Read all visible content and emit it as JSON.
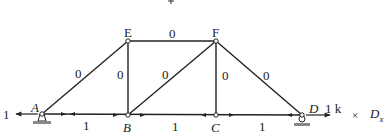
{
  "diagram": {
    "type": "truss",
    "top_marker": "+",
    "nodes": [
      {
        "id": "A",
        "label": "A",
        "x": 42,
        "y": 114,
        "italic": true
      },
      {
        "id": "B",
        "label": "B",
        "x": 128,
        "y": 115,
        "italic": true
      },
      {
        "id": "C",
        "label": "C",
        "x": 216,
        "y": 115,
        "italic": true
      },
      {
        "id": "D",
        "label": "D",
        "x": 302,
        "y": 115,
        "italic": true
      },
      {
        "id": "E",
        "label": "E",
        "x": 128,
        "y": 41,
        "italic": false
      },
      {
        "id": "F",
        "label": "F",
        "x": 216,
        "y": 41,
        "italic": false
      }
    ],
    "members": [
      {
        "from": "A",
        "to": "B",
        "force": "1"
      },
      {
        "from": "B",
        "to": "C",
        "force": "1"
      },
      {
        "from": "C",
        "to": "D",
        "force": "1"
      },
      {
        "from": "E",
        "to": "F",
        "force": "0"
      },
      {
        "from": "A",
        "to": "E",
        "force": "0"
      },
      {
        "from": "B",
        "to": "E",
        "force": "0"
      },
      {
        "from": "B",
        "to": "F",
        "force": "0"
      },
      {
        "from": "C",
        "to": "F",
        "force": "0"
      },
      {
        "from": "D",
        "to": "F",
        "force": "0"
      }
    ],
    "reaction_A": "1",
    "load_D": "1 k",
    "multiplier_symbol": "×",
    "unit_case": "D",
    "unit_case_sub": "x"
  }
}
